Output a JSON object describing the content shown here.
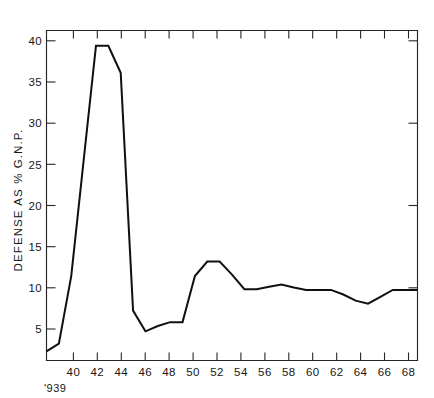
{
  "figure": {
    "width": 434,
    "height": 398,
    "background": "#ffffff",
    "ink_color": "#101010",
    "origin_note": "'939"
  },
  "chart_data": {
    "type": "line",
    "title": "",
    "subtitle": "",
    "xlabel": "",
    "ylabel": "DEFENSE AS % G.N.P.",
    "xlim": [
      1939,
      1969
    ],
    "ylim": [
      0,
      43
    ],
    "grid": false,
    "legend": null,
    "x_tick_labels": [
      "40",
      "42",
      "44",
      "46",
      "48",
      "50",
      "52",
      "54",
      "56",
      "58",
      "60",
      "62",
      "64",
      "66",
      "68"
    ],
    "x_tick_values": [
      1940,
      1942,
      1944,
      1946,
      1948,
      1950,
      1952,
      1954,
      1956,
      1958,
      1960,
      1962,
      1964,
      1966,
      1968
    ],
    "x_minor_tick_values": [
      1941,
      1943,
      1945,
      1947,
      1949,
      1951,
      1953,
      1955,
      1957,
      1959,
      1961,
      1963,
      1965,
      1967,
      1969
    ],
    "y_tick_labels": [
      "5",
      "10",
      "15",
      "20",
      "25",
      "30",
      "35",
      "40"
    ],
    "y_tick_values": [
      5,
      10,
      15,
      20,
      25,
      30,
      35,
      40
    ],
    "x": [
      1939,
      1940,
      1941,
      1942,
      1943,
      1944,
      1945,
      1946,
      1947,
      1948,
      1949,
      1950,
      1951,
      1952,
      1953,
      1954,
      1955,
      1956,
      1957,
      1958,
      1959,
      1960,
      1961,
      1962,
      1963,
      1964,
      1965,
      1966,
      1967,
      1968,
      1969
    ],
    "values": [
      1.2,
      2.2,
      11.0,
      26.0,
      41.0,
      41.0,
      37.5,
      6.5,
      3.8,
      4.5,
      5.0,
      5.0,
      11.0,
      12.9,
      12.9,
      11.2,
      9.3,
      9.3,
      9.6,
      9.9,
      9.5,
      9.2,
      9.2,
      9.2,
      8.6,
      7.8,
      7.4,
      8.3,
      9.2,
      9.2,
      9.2
    ],
    "series": [
      {
        "name": "Defense as % G.N.P.",
        "color": "#101010",
        "values": [
          1.2,
          2.2,
          11.0,
          26.0,
          41.0,
          41.0,
          37.5,
          6.5,
          3.8,
          4.5,
          5.0,
          5.0,
          11.0,
          12.9,
          12.9,
          11.2,
          9.3,
          9.3,
          9.6,
          9.9,
          9.5,
          9.2,
          9.2,
          9.2,
          8.6,
          7.8,
          7.4,
          8.3,
          9.2,
          9.2,
          9.2
        ]
      }
    ]
  }
}
